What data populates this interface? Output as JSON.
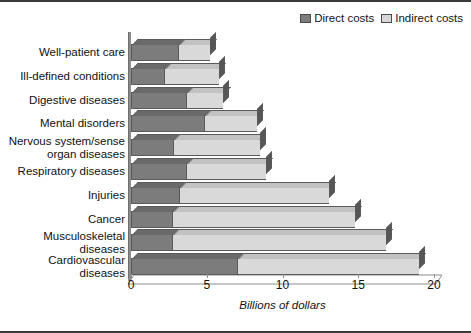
{
  "chart_data": {
    "type": "bar",
    "orientation": "horizontal",
    "stacked": true,
    "title": "",
    "xlabel": "Billions of dollars",
    "ylabel": "",
    "xlim": [
      0,
      20
    ],
    "xticks": [
      0,
      5,
      10,
      15,
      20
    ],
    "grid": false,
    "legend_position": "top-right",
    "categories": [
      "Well-patient care",
      "Ill-defined conditions",
      "Digestive diseases",
      "Mental disorders",
      "Nervous system/sense\norgan diseases",
      "Respiratory diseases",
      "Injuries",
      "Cancer",
      "Musculoskeletal\ndiseases",
      "Cardiovascular\ndiseases"
    ],
    "series": [
      {
        "name": "Direct costs",
        "color": "#7c7c7c",
        "values": [
          3.1,
          2.2,
          3.6,
          4.8,
          2.8,
          3.6,
          3.2,
          2.7,
          2.7,
          7.0
        ]
      },
      {
        "name": "Indirect costs",
        "color": "#d9d9d9",
        "values": [
          2.1,
          3.6,
          2.5,
          3.5,
          5.7,
          5.3,
          9.9,
          12.1,
          14.1,
          12.0
        ]
      }
    ],
    "totals": [
      5.2,
      5.8,
      6.1,
      8.3,
      8.5,
      8.9,
      13.1,
      14.8,
      16.8,
      19.0
    ]
  },
  "legend": {
    "entries": [
      {
        "label": "Direct costs",
        "swatch": "direct"
      },
      {
        "label": "Indirect costs",
        "swatch": "indirect"
      }
    ]
  },
  "axis": {
    "x_title": "Billions of dollars"
  }
}
